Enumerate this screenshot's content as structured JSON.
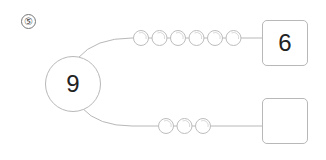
{
  "question_number": "⑤",
  "center": {
    "value": "9"
  },
  "branches": [
    {
      "bead_count": 6,
      "answer": "6"
    },
    {
      "bead_count": 3,
      "answer": ""
    }
  ],
  "colors": {
    "line": "#b8b8b8",
    "bead_stroke": "#bdbdbd",
    "text": "#222222"
  }
}
